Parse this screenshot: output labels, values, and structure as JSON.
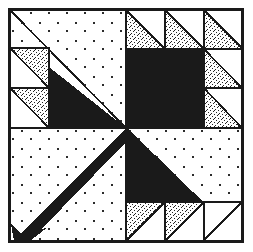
{
  "figure": {
    "kind": "pieced-quilt-block",
    "canvas": {
      "width": 253,
      "height": 252,
      "background": "#ffffff"
    }
  },
  "colors": {
    "background": "#ffffff",
    "ink": "#1a1a1a",
    "solid_dark": "#1a1a1a",
    "stipple_fill": "#ffffff",
    "stipple_dot": "#242424",
    "dotted_bg_fill": "#ffffff",
    "dotted_bg_dot": "#2b2b2b",
    "frame_stroke": "#1a1a1a"
  },
  "frame": {
    "name": "outer-border",
    "x": 9,
    "y": 9,
    "width": 234,
    "height": 233,
    "stroke_width": 2.2
  },
  "grid": {
    "center_x": 126,
    "center_y": 128,
    "unit": 39,
    "divider_stroke_width": 1.6,
    "note": "Block is a 6x6 unit grid; quadrants split at the center lines."
  },
  "quadrants": [
    {
      "name": "top-left",
      "label": "Top Left Quadrant",
      "fill_style": "dotted-background",
      "features": [
        "thin black diagonal line from corner to center",
        "large solid dark triangle below the diagonal",
        "two stippled half-square triangles stacked at left"
      ]
    },
    {
      "name": "top-right",
      "label": "Top Right Quadrant",
      "fill_style": "dotted-background",
      "features": [
        "solid dark square in the inner corner",
        "three stippled half-square triangles along the top row",
        "two stippled half-square triangles along the right column"
      ]
    },
    {
      "name": "bottom-left",
      "label": "Bottom Left Quadrant",
      "fill_style": "dotted-background",
      "features": [
        "thick solid dark diagonal band from center to lower-left",
        "arrowhead terminal at the lower-left corner"
      ]
    },
    {
      "name": "bottom-right",
      "label": "Bottom Right Quadrant",
      "fill_style": "dotted-background",
      "features": [
        "large solid dark triangle filling the upper-left half",
        "three stippled half-square triangles along the bottom row"
      ]
    }
  ],
  "patches": {
    "solid_dark_count": 4,
    "stippled_triangle_count": 10,
    "dotted_background_regions": 4
  },
  "stipple_triangles": [
    {
      "name": "stipple-tl-upper",
      "quadrant": "top-left",
      "x": 9,
      "y": 48,
      "size": 40,
      "orientation": "stipple-upper-right"
    },
    {
      "name": "stipple-tl-lower",
      "quadrant": "top-left",
      "x": 9,
      "y": 89,
      "size": 40,
      "orientation": "stipple-upper-right"
    },
    {
      "name": "stipple-tr-top-1",
      "quadrant": "top-right",
      "x": 127,
      "y": 10,
      "size": 39,
      "orientation": "stipple-lower-left"
    },
    {
      "name": "stipple-tr-top-2",
      "quadrant": "top-right",
      "x": 166,
      "y": 10,
      "size": 39,
      "orientation": "stipple-lower-left"
    },
    {
      "name": "stipple-tr-top-3",
      "quadrant": "top-right",
      "x": 205,
      "y": 10,
      "size": 38,
      "orientation": "stipple-lower-left"
    },
    {
      "name": "stipple-tr-side-1",
      "quadrant": "top-right",
      "x": 205,
      "y": 49,
      "size": 38,
      "orientation": "stipple-lower-left"
    },
    {
      "name": "stipple-tr-side-2",
      "quadrant": "top-right",
      "x": 205,
      "y": 88,
      "size": 38,
      "orientation": "stipple-lower-left"
    },
    {
      "name": "stipple-br-bot-1",
      "quadrant": "bottom-right",
      "x": 127,
      "y": 203,
      "size": 39,
      "orientation": "stipple-upper-left"
    },
    {
      "name": "stipple-br-bot-2",
      "quadrant": "bottom-right",
      "x": 166,
      "y": 203,
      "size": 39,
      "orientation": "stipple-upper-left"
    },
    {
      "name": "stipple-br-bot-3",
      "quadrant": "bottom-right",
      "x": 205,
      "y": 203,
      "size": 38,
      "orientation": "stipple-upper-left"
    }
  ],
  "dark_shapes": [
    {
      "name": "dark-triangle-top-left",
      "type": "triangle",
      "points": "50,68 126,128 50,128 50,68"
    },
    {
      "name": "dark-square-top-right",
      "type": "rect",
      "x": 126,
      "y": 50,
      "width": 79,
      "height": 78
    },
    {
      "name": "dark-triangle-bottom-right",
      "type": "triangle",
      "points": "126,128 126,207 205,207 126,128"
    },
    {
      "name": "dark-arrow-bottom-left",
      "type": "arrow",
      "from": "126,128",
      "to": "18,233"
    }
  ],
  "thin_lines": [
    {
      "name": "hairline-top-left-diagonal",
      "from": "10,10",
      "to": "126,128",
      "stroke_width": 1.6
    },
    {
      "name": "hairline-bottom-right-diagonal",
      "from": "126,128",
      "to": "242,241",
      "stroke_width": 1.6
    }
  ]
}
